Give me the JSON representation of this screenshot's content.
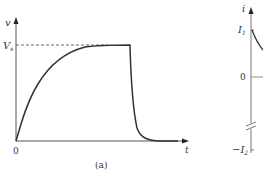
{
  "figure_a": {
    "y_axis_label": "v",
    "x_axis_label": "t",
    "level_label": "V",
    "level_subscript": "s",
    "origin_label": "0",
    "caption": "(a)",
    "curve": "Rising exponential from 0 to V_s, holds at V_s, then falls exponentially back to 0"
  },
  "figure_b": {
    "y_axis_label": "i",
    "tick_top_label": "I",
    "tick_top_subscript": "1",
    "tick_zero_label": "0",
    "tick_bottom_label": "−I",
    "tick_bottom_subscript": "2",
    "curve": "Decaying current starting at I1 (partially visible, cropped)"
  },
  "colors": {
    "stroke": "#333333",
    "axis": "#555555",
    "background": "#ffffff"
  }
}
